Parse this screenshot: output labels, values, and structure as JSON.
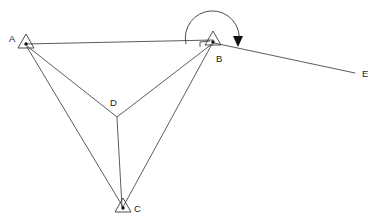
{
  "diagram": {
    "canvas": {
      "width": 385,
      "height": 224
    },
    "colors": {
      "background": "#ffffff",
      "line": "#4a4a4a",
      "symbol": "#3a3a3a",
      "marker": "#111111",
      "label": "#1c1c1c"
    },
    "stations": [
      {
        "id": "A",
        "label": "A",
        "x": 26,
        "y": 44,
        "symbol": "triangle-station",
        "label_x": 9,
        "label_y": 42
      },
      {
        "id": "B",
        "label": "B",
        "x": 213,
        "y": 41,
        "symbol": "triangle-station",
        "label_x": 216,
        "label_y": 62
      },
      {
        "id": "C",
        "label": "C",
        "x": 123,
        "y": 208,
        "symbol": "triangle-station",
        "label_x": 134,
        "label_y": 211
      },
      {
        "id": "D",
        "label": "D",
        "x": 117,
        "y": 117,
        "symbol": "junction-point",
        "label_x": 110,
        "label_y": 106
      },
      {
        "id": "E",
        "label": "E",
        "x": 355,
        "y": 73,
        "symbol": "endpoint",
        "label_x": 362,
        "label_y": 77
      }
    ],
    "lines": [
      {
        "name": "line-a-b",
        "from": "A",
        "to": "B"
      },
      {
        "name": "line-a-d",
        "from": "A",
        "to": "D"
      },
      {
        "name": "line-a-c",
        "from": "A",
        "to": "C"
      },
      {
        "name": "line-b-d",
        "from": "B",
        "to": "D"
      },
      {
        "name": "line-b-c",
        "from": "B",
        "to": "C"
      },
      {
        "name": "line-d-c",
        "from": "D",
        "to": "C"
      },
      {
        "name": "line-b-e",
        "from": "B",
        "to": "E"
      }
    ],
    "annotations": {
      "angle_arc": {
        "name": "angle-arc-at-b",
        "center_x": 213,
        "center_y": 42,
        "radius": 27,
        "start_deg": 183,
        "end_deg": 357,
        "direction": "clockwise"
      },
      "arrow": {
        "name": "direction-arrowhead",
        "x": 238,
        "y": 43,
        "points_to": "down"
      },
      "right_angle": {
        "name": "right-angle-marker-at-b",
        "x": 204,
        "y": 44
      }
    }
  }
}
